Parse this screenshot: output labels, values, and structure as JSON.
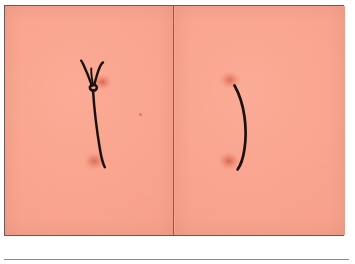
{
  "figure": {
    "type": "photographic-figure",
    "panel_count": 2,
    "caption": "",
    "background_color": "#ffffff"
  },
  "plate": {
    "border_color": "#6d5a57",
    "divider_color": "#7a6260",
    "tissue_color": "#f9a48e",
    "tissue_shadow_color": "#f49e88",
    "suture_color": "#1a1110",
    "puncture_color": "#d9604a"
  },
  "panels": [
    {
      "id": "panel-left",
      "position": "left",
      "label": "",
      "content_description": "tied suture knot with two cut thread tails and a strand running down to the tissue",
      "elements": [
        {
          "name": "suture-knot",
          "description": "square knot cinched at the skin surface"
        },
        {
          "name": "suture-tail-left",
          "description": "short cut tail angling up and to the left"
        },
        {
          "name": "suture-tail-right",
          "description": "short cut tail angling up and to the right"
        },
        {
          "name": "suture-strand",
          "description": "long strand descending from the knot"
        },
        {
          "name": "puncture-upper",
          "description": "needle entry mark beside the knot"
        },
        {
          "name": "puncture-lower",
          "description": "needle mark at the lower strand end"
        },
        {
          "name": "tissue-speck",
          "description": "small dark speck on the tissue"
        }
      ]
    },
    {
      "id": "panel-right",
      "position": "right",
      "label": "",
      "content_description": "single untied curved suture strand spanning two puncture sites",
      "elements": [
        {
          "name": "suture-strand",
          "description": "curved strand bowing to the right"
        },
        {
          "name": "puncture-upper",
          "description": "needle entry mark at the top of the strand"
        },
        {
          "name": "puncture-lower",
          "description": "needle exit mark at the bottom of the strand"
        }
      ]
    }
  ],
  "footer": {
    "rule_color": "#8a8a8a"
  }
}
